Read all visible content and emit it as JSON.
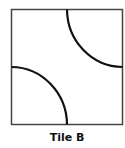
{
  "figure": {
    "caption": "Tile B",
    "tile": {
      "shape": "square",
      "border_color": "#444444",
      "arc_color": "#111111",
      "arcs": [
        {
          "corner": "top-right",
          "description": "quarter circle arc centered at top-right corner"
        },
        {
          "corner": "bottom-left",
          "description": "quarter circle arc centered at bottom-left corner"
        }
      ]
    }
  }
}
